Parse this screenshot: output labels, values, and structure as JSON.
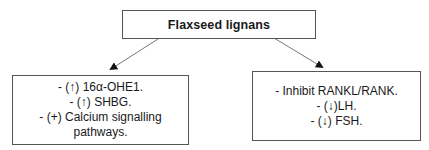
{
  "diagram": {
    "root": {
      "label": "Flaxseed lignans"
    },
    "left_branch": {
      "items": [
        "- (↑) 16α-OHE1.",
        "- (↑) SHBG.",
        "- (+) Calcium signalling",
        "pathways."
      ]
    },
    "right_branch": {
      "items": [
        "- Inhibit RANKL/RANK.",
        "- (↓)LH.",
        "- (↓) FSH."
      ]
    },
    "edges": [
      {
        "from": "Flaxseed lignans",
        "to": "left_branch"
      },
      {
        "from": "Flaxseed lignans",
        "to": "right_branch"
      }
    ],
    "colors": {
      "border": "#555555",
      "arrow": "#777777",
      "text": "#1a1a1a"
    }
  }
}
